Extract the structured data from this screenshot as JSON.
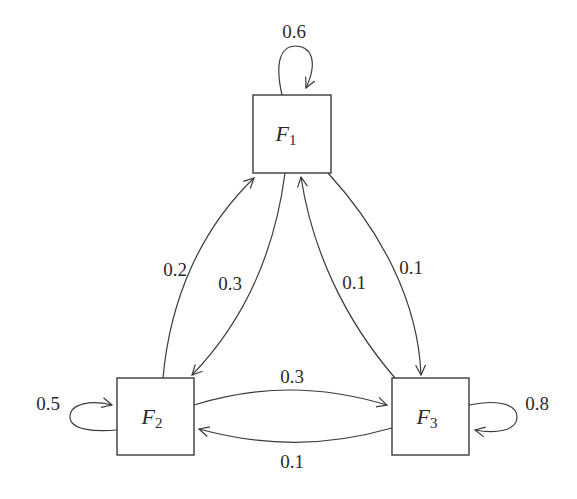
{
  "diagram": {
    "type": "markov-chain-state-diagram",
    "nodes": [
      {
        "id": "F1",
        "label": "F",
        "subscript": "1"
      },
      {
        "id": "F2",
        "label": "F",
        "subscript": "2"
      },
      {
        "id": "F3",
        "label": "F",
        "subscript": "3"
      }
    ],
    "edges": [
      {
        "from": "F1",
        "to": "F1",
        "label": "0.6"
      },
      {
        "from": "F2",
        "to": "F2",
        "label": "0.5"
      },
      {
        "from": "F3",
        "to": "F3",
        "label": "0.8"
      },
      {
        "from": "F2",
        "to": "F1",
        "label": "0.2"
      },
      {
        "from": "F1",
        "to": "F2",
        "label": "0.3"
      },
      {
        "from": "F3",
        "to": "F1",
        "label": "0.1"
      },
      {
        "from": "F1",
        "to": "F3",
        "label": "0.1"
      },
      {
        "from": "F2",
        "to": "F3",
        "label": "0.3"
      },
      {
        "from": "F3",
        "to": "F2",
        "label": "0.1"
      }
    ],
    "colors": {
      "stroke": "#3a3a3a",
      "text": "#2a2a2a",
      "background": "#ffffff"
    }
  }
}
